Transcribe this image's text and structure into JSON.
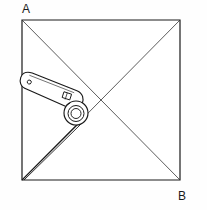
{
  "figure": {
    "canvas": {
      "width": 207,
      "height": 210
    },
    "background_color": "#fefefe",
    "line_color": "#1a1a1a",
    "fill_color": "#ffffff"
  },
  "labels": {
    "top_left": "A",
    "bottom_right": "B"
  },
  "square": {
    "name": "sheet-outline",
    "x1": 22,
    "y1": 20,
    "x2": 180,
    "y2": 180,
    "stroke_width": 1.2,
    "stroke": "#1a1a1a"
  },
  "diagonals": {
    "name": "diagonal-lines",
    "stroke": "#333333",
    "stroke_width": 0.8,
    "lines": [
      {
        "id": "diagonal-a-to-b",
        "x1": 22,
        "y1": 20,
        "x2": 180,
        "y2": 180
      },
      {
        "id": "diagonal-top-right-to-bottom-left",
        "x1": 180,
        "y1": 20,
        "x2": 22,
        "y2": 180
      }
    ],
    "intersection": {
      "x": 101,
      "y": 100
    }
  },
  "crease": {
    "name": "fold-crease",
    "stroke": "#1a1a1a",
    "stroke_width": 1.1,
    "from": {
      "x": 22,
      "y": 180
    },
    "to": {
      "x": 79,
      "y": 123
    },
    "offset_line": {
      "x1": 24,
      "y1": 180,
      "x2": 81,
      "y2": 124
    }
  },
  "lever": {
    "name": "cam-lever",
    "stroke": "#1a1a1a",
    "stroke_width": 1.1,
    "fill": "#ffffff",
    "angle_degrees": 18,
    "eye_end": {
      "x": 20,
      "y": 97,
      "radius": 7
    },
    "eye_hole": {
      "x": 22,
      "y": 98,
      "radius": 2
    },
    "hub": {
      "x": 76,
      "y": 113,
      "outer_radius": 12,
      "mid_radius": 8,
      "inner_radius": 5
    },
    "notch": {
      "x": 58,
      "y": 104,
      "width": 8,
      "height": 6
    }
  }
}
